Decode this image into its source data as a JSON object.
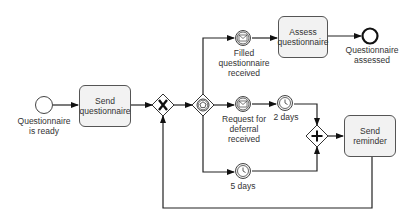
{
  "diagram": {
    "type": "BPMN process",
    "events": {
      "start": {
        "label": "Questionnaire\nis ready"
      },
      "filled_received": {
        "label": "Filled\nquestionnaire\nreceived",
        "kind": "message-catch"
      },
      "deferral_received": {
        "label": "Request for\ndeferral\nreceived",
        "kind": "message-catch"
      },
      "timer_2days": {
        "label": "2 days",
        "kind": "timer"
      },
      "timer_5days": {
        "label": "5 days",
        "kind": "timer"
      },
      "end": {
        "label": "Questionnaire\nassessed"
      }
    },
    "tasks": {
      "send_questionnaire": "Send\nquestionnaire",
      "assess_questionnaire": "Assess\nquestionnaire",
      "send_reminder": "Send\nreminder"
    },
    "gateways": {
      "xor_merge": {
        "kind": "exclusive",
        "symbol": "X"
      },
      "event_based": {
        "kind": "event-based"
      },
      "parallel_join": {
        "kind": "parallel",
        "symbol": "+"
      }
    },
    "colors": {
      "stroke": "#222222",
      "task_fill": "#f2f2f2",
      "text": "#333333"
    }
  }
}
